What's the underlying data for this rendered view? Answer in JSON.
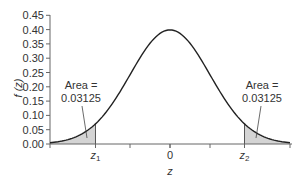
{
  "chart_data": {
    "type": "area",
    "title": "",
    "xlabel": "z",
    "ylabel": "f (z)",
    "ylim": [
      0,
      0.45
    ],
    "xlim": [
      -3,
      3
    ],
    "yticks": [
      "0.00",
      "0.05",
      "0.10",
      "0.15",
      "0.20",
      "0.25",
      "0.30",
      "0.35",
      "0.40",
      "0.45"
    ],
    "xtick_labels": [
      {
        "z": -1.8627,
        "label": "z",
        "sub": "1"
      },
      {
        "z": 0,
        "label": "0",
        "sub": ""
      },
      {
        "z": 1.8627,
        "label": "z",
        "sub": "2"
      }
    ],
    "minor_xticks": [
      -3,
      -1,
      0,
      1,
      3
    ],
    "series": [
      {
        "name": "Standard normal density",
        "function": "phi(z)",
        "peak": 0.4
      }
    ],
    "shaded_regions": [
      {
        "from": -3,
        "to": -1.8627,
        "area": 0.03125
      },
      {
        "from": 1.8627,
        "to": 3,
        "area": 0.03125
      }
    ],
    "annotations": [
      {
        "line1": "Area =",
        "line2": "0.03125",
        "side": "left"
      },
      {
        "line1": "Area =",
        "line2": "0.03125",
        "side": "right"
      }
    ],
    "grid": false,
    "legend": null
  },
  "colors": {
    "curve": "#222222",
    "shade": "#d4d4d4",
    "axis": "#666666"
  }
}
